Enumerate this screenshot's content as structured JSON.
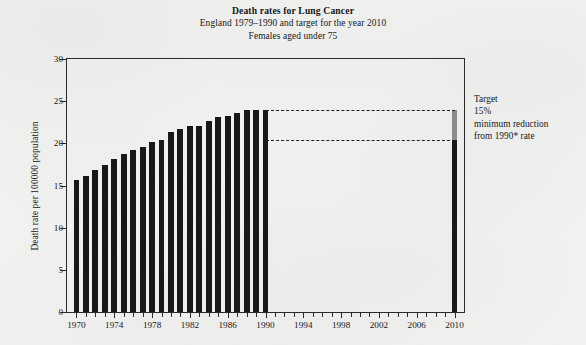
{
  "chart_data": {
    "type": "bar",
    "title": "Death rates for Lung Cancer",
    "subtitle_1": "England 1979–1990 and target for the year 2010",
    "subtitle_2": "Females aged under 75",
    "xlabel": "",
    "ylabel": "Death rate per 100000 population",
    "ylim": [
      0,
      30
    ],
    "ytick_values": [
      0,
      5,
      10,
      15,
      20,
      25,
      30
    ],
    "ytick_labels": [
      "0",
      "5",
      "10",
      "15",
      "20",
      "25",
      "30"
    ],
    "xlim": [
      1969,
      2011
    ],
    "xtick_labels": [
      "1970",
      "1974",
      "1978",
      "1982",
      "1986",
      "1990",
      "1994",
      "1998",
      "2002",
      "2006",
      "2010"
    ],
    "xtick_values": [
      1970,
      1974,
      1978,
      1982,
      1986,
      1990,
      1994,
      1998,
      2002,
      2006,
      2010
    ],
    "minor_ticks_every": 1,
    "grid": false,
    "legend": "none",
    "categories": [
      1970,
      1971,
      1972,
      1973,
      1974,
      1975,
      1976,
      1977,
      1978,
      1979,
      1980,
      1981,
      1982,
      1983,
      1984,
      1985,
      1986,
      1987,
      1988,
      1989,
      1990
    ],
    "values": [
      15.7,
      16.1,
      16.8,
      17.4,
      18.2,
      18.7,
      19.2,
      19.6,
      20.2,
      20.4,
      21.3,
      21.7,
      22.0,
      22.1,
      22.6,
      23.1,
      23.3,
      23.6,
      23.9,
      24.0,
      24.0
    ],
    "bar_color": "#18181a",
    "target": {
      "year": 2010,
      "baseline_value": 24.0,
      "target_value": 20.4,
      "reduction_percent": 15,
      "lower_segment_color": "#18181a",
      "upper_segment_color": "#8d8d8d"
    },
    "reference_lines": [
      {
        "value": 24.0,
        "style": "dashed",
        "from_year": 1990,
        "to_year": 2010
      },
      {
        "value": 20.4,
        "style": "dashed",
        "from_year": 1990,
        "to_year": 2010
      }
    ],
    "annotations": [
      {
        "name": "target-annotation",
        "lines": [
          "Target",
          "15%",
          "minimum reduction",
          "from 1990* rate"
        ]
      }
    ]
  },
  "annotation": {
    "line_1": "Target",
    "line_2": "15%",
    "line_3": "minimum reduction",
    "line_4": "from 1990* rate"
  }
}
